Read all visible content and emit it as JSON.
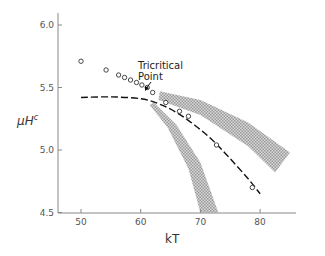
{
  "chart_data": {
    "type": "scatter",
    "title": "",
    "xlabel": "kT",
    "ylabel": "μH^c",
    "ylabel_main": "μH",
    "ylabel_sup": "c",
    "xlim": [
      46,
      86
    ],
    "ylim": [
      4.5,
      6.1
    ],
    "x_ticks": [
      50,
      60,
      70,
      80
    ],
    "x_tick_labels": [
      "50",
      "60",
      "70",
      "80"
    ],
    "y_ticks": [
      4.5,
      5.0,
      5.5,
      6.0
    ],
    "y_tick_labels": [
      "4.5",
      "5.0",
      "5.5",
      "6.0"
    ],
    "grid": false,
    "series": [
      {
        "name": "data points",
        "kind": "open-circles",
        "points": [
          {
            "x": 50.0,
            "y": 5.71
          },
          {
            "x": 54.2,
            "y": 5.64
          },
          {
            "x": 56.3,
            "y": 5.6
          },
          {
            "x": 57.3,
            "y": 5.58
          },
          {
            "x": 58.3,
            "y": 5.56
          },
          {
            "x": 59.3,
            "y": 5.54
          },
          {
            "x": 60.2,
            "y": 5.52
          },
          {
            "x": 61.1,
            "y": 5.5
          },
          {
            "x": 62.0,
            "y": 5.46
          },
          {
            "x": 64.2,
            "y": 5.38
          },
          {
            "x": 66.5,
            "y": 5.31
          },
          {
            "x": 68.0,
            "y": 5.27
          },
          {
            "x": 72.7,
            "y": 5.04
          },
          {
            "x": 78.7,
            "y": 4.7
          }
        ]
      },
      {
        "name": "dashed curve",
        "kind": "dashed-line",
        "points": [
          {
            "x": 50.0,
            "y": 5.42
          },
          {
            "x": 55.0,
            "y": 5.425
          },
          {
            "x": 60.0,
            "y": 5.41
          },
          {
            "x": 63.0,
            "y": 5.37
          },
          {
            "x": 66.0,
            "y": 5.3
          },
          {
            "x": 69.0,
            "y": 5.2
          },
          {
            "x": 72.0,
            "y": 5.08
          },
          {
            "x": 75.0,
            "y": 4.93
          },
          {
            "x": 78.0,
            "y": 4.77
          },
          {
            "x": 80.0,
            "y": 4.65
          }
        ]
      },
      {
        "name": "shaded band (upper)",
        "kind": "hatched-band",
        "upper": [
          {
            "x": 63.2,
            "y": 5.47
          },
          {
            "x": 70.0,
            "y": 5.4
          },
          {
            "x": 78.0,
            "y": 5.22
          },
          {
            "x": 85.0,
            "y": 4.98
          }
        ],
        "lower": [
          {
            "x": 63.0,
            "y": 5.4
          },
          {
            "x": 70.0,
            "y": 5.28
          },
          {
            "x": 78.0,
            "y": 5.03
          },
          {
            "x": 82.5,
            "y": 4.82
          }
        ]
      },
      {
        "name": "shaded band (lower)",
        "kind": "hatched-band",
        "upper": [
          {
            "x": 62.2,
            "y": 5.38
          },
          {
            "x": 66.0,
            "y": 5.2
          },
          {
            "x": 70.0,
            "y": 4.9
          },
          {
            "x": 73.0,
            "y": 4.5
          }
        ],
        "lower": [
          {
            "x": 61.5,
            "y": 5.36
          },
          {
            "x": 64.5,
            "y": 5.18
          },
          {
            "x": 68.0,
            "y": 4.85
          },
          {
            "x": 70.0,
            "y": 4.5
          }
        ]
      }
    ],
    "annotations": [
      {
        "text": "Tricritical Point",
        "lines": [
          "Tricritical",
          "Point"
        ],
        "arrow_to": {
          "x": 61.1,
          "y": 5.49
        }
      }
    ]
  }
}
